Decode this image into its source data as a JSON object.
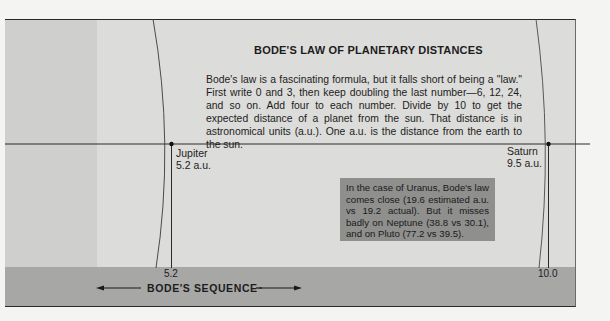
{
  "diagram": {
    "title": "BODE'S LAW OF PLANETARY DISTANCES",
    "description": "Bode's law is a fascinating formula, but it falls short of being a \"law.\" First write 0 and 3, then keep doubling the last number—6, 12, 24, and so on. Add four to each number. Divide by 10 to get the expected distance of a planet from the sun. That distance is in astronomical units (a.u.). One a.u. is the distance from the earth to the sun.",
    "planets": [
      {
        "name": "Jupiter",
        "distance": "5.2 a.u.",
        "bode_value": "5.2"
      },
      {
        "name": "Saturn",
        "distance": "9.5 a.u.",
        "bode_value": "10.0"
      }
    ],
    "callout": "In the case of Uranus, Bode's law comes close (19.6 estimated a.u. vs 19.2 actual). But it misses badly on Neptune (38.8 vs 30.1), and on Pluto (77.2 vs 39.5).",
    "axis": {
      "label": "BODE'S SEQUENCE",
      "left_arrow": "←",
      "right_arrow": "→"
    },
    "colors": {
      "panel": "#dcdcda",
      "band": "#a7a7a5",
      "callout": "#8f8f8d",
      "line": "#2a2a2a"
    }
  }
}
